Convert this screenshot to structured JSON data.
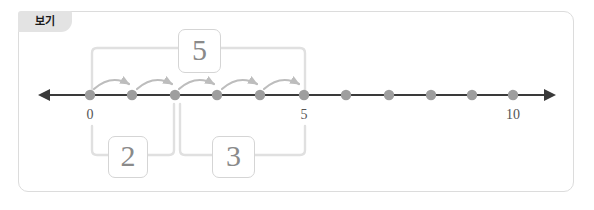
{
  "panel": {
    "tab_label": "보기",
    "background": "#ffffff",
    "border_color": "#dcdcdc",
    "tab_background": "#e3e3e3"
  },
  "diagram": {
    "kind": "number-line-addition",
    "colors": {
      "line": "#3a3a3a",
      "dot": "#9e9e9e",
      "hop_arrow": "#bdbdbd",
      "bracket": "#e0e0e0",
      "box_border": "#d5d5d5",
      "box_text": "#8a8a8a",
      "tick_text": "#555555"
    },
    "number_line": {
      "min": 0,
      "max": 10,
      "dot_count": 11,
      "tick_labels": [
        {
          "value": 0,
          "text": "0"
        },
        {
          "value": 5,
          "text": "5"
        },
        {
          "value": 10,
          "text": "10"
        }
      ],
      "arrow_heads": [
        "left",
        "right"
      ]
    },
    "hops": {
      "count": 5,
      "from": 0,
      "to": 5,
      "step": 1,
      "direction": "right",
      "style": "curved-arc-above"
    },
    "brackets": [
      {
        "name": "sum-bracket",
        "position": "above",
        "from": 0,
        "to": 5,
        "label": "5"
      },
      {
        "name": "addend-bracket-1",
        "position": "below",
        "from": 0,
        "to": 2,
        "label": "2"
      },
      {
        "name": "addend-bracket-2",
        "position": "below",
        "from": 2,
        "to": 5,
        "label": "3"
      }
    ],
    "equation": {
      "addend_1": "2",
      "addend_2": "3",
      "sum": "5"
    }
  }
}
